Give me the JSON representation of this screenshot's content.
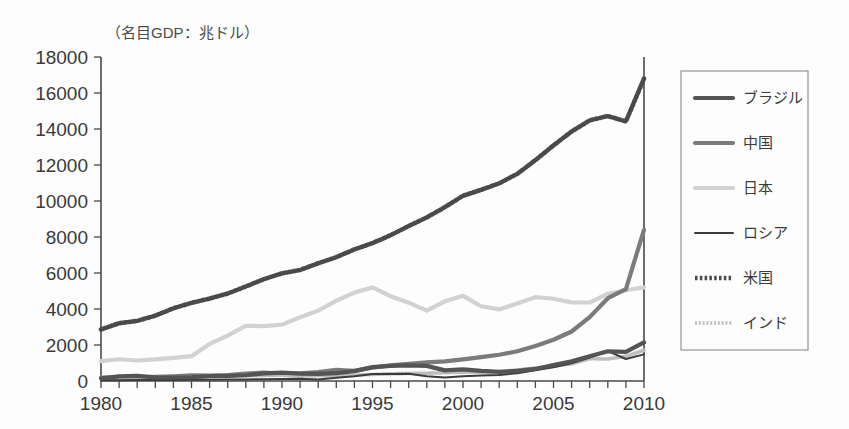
{
  "chart_data": {
    "type": "line",
    "title": "（名目GDP：兆ドル）",
    "xlabel": "",
    "ylabel": "",
    "grid": false,
    "legend_position": "right",
    "xlim": [
      1980,
      2010
    ],
    "ylim": [
      0,
      18000
    ],
    "ytick_step": 2000,
    "xtick_step": 1,
    "x": [
      1980,
      1981,
      1982,
      1983,
      1984,
      1985,
      1986,
      1987,
      1988,
      1989,
      1990,
      1991,
      1992,
      1993,
      1994,
      1995,
      1996,
      1997,
      1998,
      1999,
      2000,
      2001,
      2002,
      2003,
      2004,
      2005,
      2006,
      2007,
      2008,
      2009,
      2010
    ],
    "xticklabels": [
      "1980",
      "1985",
      "1990",
      "1995",
      "2000",
      "2005",
      "2010"
    ],
    "xticklabel_values": [
      1980,
      1985,
      1990,
      1995,
      2000,
      2005,
      2010
    ],
    "yticklabels": [
      "0",
      "2000",
      "4000",
      "6000",
      "8000",
      "10000",
      "12000",
      "14000",
      "16000",
      "18000"
    ],
    "yticklabel_values": [
      0,
      2000,
      4000,
      6000,
      8000,
      10000,
      12000,
      14000,
      16000,
      18000
    ],
    "series": [
      {
        "name": "ブラジル",
        "color": "#545454",
        "style": "solid",
        "width": 4.2,
        "values": [
          150,
          260,
          280,
          200,
          200,
          220,
          270,
          290,
          320,
          420,
          460,
          410,
          400,
          440,
          550,
          770,
          840,
          870,
          840,
          590,
          650,
          560,
          510,
          560,
          670,
          890,
          1100,
          1370,
          1650,
          1620,
          2140
        ]
      },
      {
        "name": "中国",
        "color": "#7b7b7b",
        "style": "solid",
        "width": 4.2,
        "values": [
          190,
          195,
          205,
          230,
          260,
          310,
          300,
          330,
          410,
          460,
          400,
          420,
          490,
          620,
          570,
          740,
          870,
          960,
          1030,
          1090,
          1200,
          1330,
          1460,
          1650,
          1950,
          2290,
          2750,
          3550,
          4600,
          5110,
          8400
        ]
      },
      {
        "name": "日本",
        "color": "#d2d2d2",
        "style": "solid",
        "width": 4.2,
        "values": [
          1100,
          1210,
          1140,
          1200,
          1280,
          1380,
          2060,
          2520,
          3070,
          3050,
          3130,
          3540,
          3910,
          4460,
          4910,
          5200,
          4710,
          4350,
          3910,
          4430,
          4730,
          4150,
          3980,
          4300,
          4660,
          4570,
          4370,
          4360,
          4850,
          5040,
          5200
        ]
      },
      {
        "name": "ロシア",
        "color": "#3c3c3c",
        "style": "solid",
        "width": 2.0,
        "values": [
          40,
          45,
          50,
          55,
          60,
          65,
          70,
          80,
          90,
          100,
          110,
          120,
          90,
          180,
          270,
          390,
          390,
          400,
          270,
          190,
          260,
          300,
          340,
          430,
          590,
          760,
          990,
          1300,
          1660,
          1220,
          1480
        ]
      },
      {
        "name": "米国",
        "color": "#4a4a4a",
        "style": "dotted",
        "width": 4.6,
        "values": [
          2860,
          3210,
          3340,
          3630,
          4040,
          4340,
          4580,
          4860,
          5250,
          5660,
          5980,
          6170,
          6540,
          6880,
          7310,
          7660,
          8100,
          8610,
          9090,
          9660,
          10290,
          10620,
          10980,
          11510,
          12270,
          13090,
          13860,
          14480,
          14720,
          14420,
          16800
        ]
      },
      {
        "name": "インド",
        "color": "#bdbdbd",
        "style": "dotted",
        "width": 3.6,
        "values": [
          190,
          200,
          200,
          220,
          215,
          230,
          250,
          280,
          300,
          300,
          320,
          270,
          290,
          280,
          330,
          360,
          400,
          420,
          430,
          460,
          480,
          490,
          520,
          620,
          720,
          830,
          950,
          1240,
          1220,
          1370,
          1710
        ]
      }
    ]
  }
}
